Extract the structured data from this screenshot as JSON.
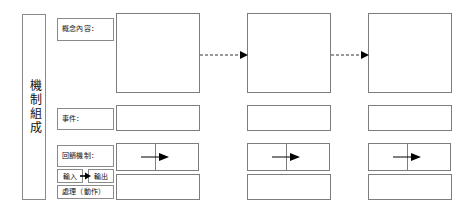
{
  "diagram": {
    "title_column": {
      "text": "機制組成",
      "orientation": "vertical"
    },
    "row_labels": [
      {
        "id": "concept",
        "text": "概念內容："
      },
      {
        "id": "event",
        "text": "事件："
      },
      {
        "id": "feedback",
        "text": "回饋機制："
      }
    ],
    "io_strip": {
      "input_label": "輸入",
      "output_label": "輸出",
      "arrow": "right-arrow"
    },
    "action_label": {
      "text": "處理（動作）"
    },
    "columns": [
      {
        "id": "stage-1",
        "concept_box": "",
        "event_box": "",
        "feedback_left": "",
        "feedback_right": "",
        "action_box": ""
      },
      {
        "id": "stage-2",
        "concept_box": "",
        "event_box": "",
        "feedback_left": "",
        "feedback_right": "",
        "action_box": ""
      },
      {
        "id": "stage-3",
        "concept_box": "",
        "event_box": "",
        "feedback_left": "",
        "feedback_right": "",
        "action_box": ""
      }
    ],
    "connectors": [
      {
        "id": "connector-1-2",
        "style": "dashed",
        "direction": "right"
      },
      {
        "id": "connector-2-3",
        "style": "dashed",
        "direction": "right"
      }
    ],
    "colors": {
      "border": "#7d7d7d",
      "label_border": "#8a8a8a",
      "text": "#111111",
      "background": "#ffffff",
      "arrow": "#000000"
    }
  }
}
